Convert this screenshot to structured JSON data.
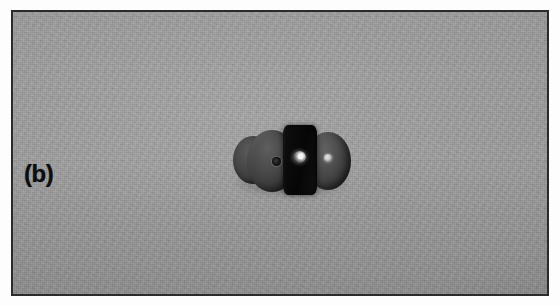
{
  "figure": {
    "panel_label": "(b)",
    "caption_text": "",
    "kind": "photograph",
    "frame": {
      "border_color": "#2b2b2b",
      "border_width_px": 2,
      "x": 11,
      "y": 10,
      "width": 538,
      "height": 286
    },
    "background": {
      "description": "uniform mid-gray textured surface",
      "color": "#9c9c9c"
    },
    "subject": {
      "description": "dark specimen assembly of two rounded discs flanking a central dark block",
      "parts": [
        {
          "name": "back-left-disc",
          "color": "#474747"
        },
        {
          "name": "left-disc",
          "color": "#3a3a3a"
        },
        {
          "name": "center-block",
          "color": "#080808"
        },
        {
          "name": "right-disc",
          "color": "#3c3c3c"
        },
        {
          "name": "left-hole",
          "color": "#171717"
        },
        {
          "name": "center-highlight",
          "color": "#ffffff"
        },
        {
          "name": "right-highlight",
          "color": "#e8e8e8"
        }
      ],
      "x": 225,
      "y": 118,
      "width": 126,
      "height": 80
    }
  },
  "colors": {
    "background_gray": "#9c9c9c",
    "border_dark": "#2b2b2b",
    "label_black": "#0d0d0d",
    "specimen_dark": "#080808",
    "highlight_white": "#ffffff"
  }
}
